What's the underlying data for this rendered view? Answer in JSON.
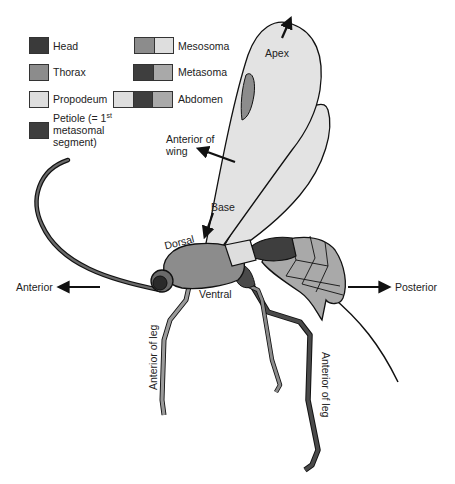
{
  "colors": {
    "head": "#3a3a3a",
    "thorax": "#8c8c8c",
    "propodeum": "#dedede",
    "petiole": "#3e3e3e",
    "wing": "#e3e3e3",
    "outline": "#111111",
    "abdomen_segments": "#a9a9a9",
    "text": "#222222"
  },
  "legend": {
    "items_left": [
      {
        "label": "Head",
        "color": "#3a3a3a"
      },
      {
        "label": "Thorax",
        "color": "#8c8c8c"
      },
      {
        "label": "Propodeum",
        "color": "#dedede"
      },
      {
        "label_line1": "Petiole (= 1",
        "label_sup": "st",
        "label_line2": "metasomal",
        "label_line3": "segment)",
        "color": "#3e3e3e"
      }
    ],
    "items_right": [
      {
        "label": "Mesosoma",
        "colors": [
          "#8c8c8c",
          "#dedede"
        ]
      },
      {
        "label": "Metasoma",
        "colors": [
          "#3e3e3e",
          "#a9a9a9"
        ]
      },
      {
        "label": "Abdomen",
        "colors": [
          "#dedede",
          "#3e3e3e",
          "#a9a9a9"
        ]
      }
    ]
  },
  "annotations": {
    "apex": "Apex",
    "anterior_of_wing_line1": "Anterior of",
    "anterior_of_wing_line2": "wing",
    "base": "Base",
    "dorsal": "Dorsal",
    "ventral": "Ventral",
    "anterior": "Anterior",
    "posterior": "Posterior",
    "anterior_of_leg_front": "Anterior of leg",
    "anterior_of_leg_hind": "Anterior of leg"
  }
}
